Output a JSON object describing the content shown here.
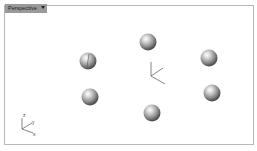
{
  "viewport": {
    "title": "Perspective",
    "dropdown_icon": "chevron-down-icon"
  },
  "scene": {
    "objects": [
      {
        "type": "sphere",
        "name": "sphere-1"
      },
      {
        "type": "sphere",
        "name": "sphere-2"
      },
      {
        "type": "sphere",
        "name": "sphere-3"
      },
      {
        "type": "sphere",
        "name": "sphere-4"
      },
      {
        "type": "sphere",
        "name": "sphere-5"
      },
      {
        "type": "sphere",
        "name": "sphere-6"
      }
    ],
    "gizmo": "world-origin-axes"
  },
  "axis_indicator": {
    "labels": {
      "z": "z",
      "y": "y",
      "x": "x"
    }
  }
}
